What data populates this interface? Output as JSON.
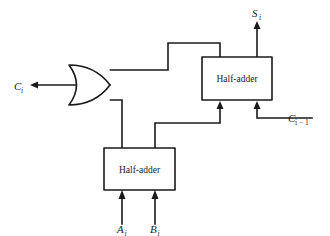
{
  "figure": {
    "background_color": "#ffffff",
    "line_color": "#1a1a1a"
  },
  "blocks": {
    "upper_half_adder": {
      "label": "Half-adder",
      "x": 202,
      "y": 57,
      "width": 70,
      "height": 43
    },
    "lower_half_adder": {
      "label": "Half-adder",
      "x": 104,
      "y": 148,
      "width": 71,
      "height": 42
    },
    "or_gate": {
      "label": "OR",
      "x": 68,
      "y": 65,
      "width": 42,
      "height": 40
    }
  },
  "signals": {
    "carry_out": {
      "name": "C",
      "subscript": "i",
      "label": "Ci"
    },
    "sum_out": {
      "name": "S",
      "subscript": "i",
      "label": "Si"
    },
    "carry_in": {
      "name": "C",
      "subscript": "i − 1",
      "label": "Ci-1"
    },
    "input_a": {
      "name": "A",
      "subscript": "i",
      "label": "Ai"
    },
    "input_b": {
      "name": "B",
      "subscript": "i",
      "label": "Bi"
    }
  },
  "wires": [
    {
      "name": "lower-sum-to-upper-input",
      "path": "M155,190 L155,123 L220,123 L220,104"
    },
    {
      "name": "lower-carry-to-or-lower-input",
      "path": "M122,190 L122,100 L110,100"
    },
    {
      "name": "or-upper-input-to-upper-sum",
      "path": "M110,70 L168,70 L168,43 L220,43 L220,57"
    },
    {
      "name": "or-output-to-carry-out",
      "path": "M110,85 L31,85"
    },
    {
      "name": "carry-in-to-upper-input",
      "path": "M315,118 L257,118 L257,104"
    },
    {
      "name": "upper-sum-output",
      "path": "M257,57 L257,22"
    },
    {
      "name": "input-a",
      "path": "M122,224 L122,194"
    },
    {
      "name": "input-b",
      "path": "M155,224 L155,194"
    }
  ]
}
